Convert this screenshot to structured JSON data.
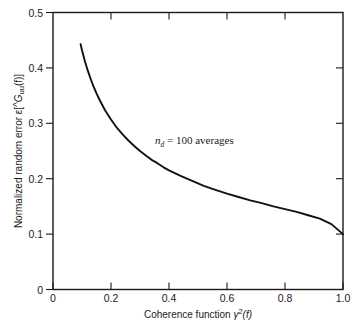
{
  "chart_data": {
    "type": "line",
    "title": "",
    "xlabel": "Coherence function γ²(f)",
    "ylabel": "Normalized random error ε[Ĝᵤᵤ(f)]",
    "xlim": [
      0,
      1.0
    ],
    "ylim": [
      0,
      0.5
    ],
    "grid": false,
    "legend": "none",
    "xticks": [
      "0",
      "0.2",
      "0.4",
      "0.6",
      "0.8",
      "1.0"
    ],
    "xtick_values": [
      0,
      0.2,
      0.4,
      0.6,
      0.8,
      1.0
    ],
    "yticks": [
      "0",
      "0.1",
      "0.2",
      "0.3",
      "0.4",
      "0.5"
    ],
    "ytick_values": [
      0,
      0.1,
      0.2,
      0.3,
      0.4,
      0.5
    ],
    "annotations": [
      {
        "text": "n_d = 100 averages",
        "x": 0.34,
        "y": 0.285
      }
    ],
    "series": [
      {
        "name": "Normalized random error",
        "n_d": 100,
        "x": [
          0.095,
          0.1,
          0.11,
          0.12,
          0.13,
          0.14,
          0.15,
          0.16,
          0.17,
          0.18,
          0.19,
          0.2,
          0.22,
          0.24,
          0.26,
          0.28,
          0.3,
          0.32,
          0.34,
          0.36,
          0.38,
          0.4,
          0.44,
          0.48,
          0.52,
          0.56,
          0.6,
          0.64,
          0.68,
          0.72,
          0.76,
          0.8,
          0.84,
          0.88,
          0.92,
          0.96,
          1.0
        ],
        "values": [
          0.443,
          0.432,
          0.412,
          0.395,
          0.38,
          0.366,
          0.354,
          0.343,
          0.333,
          0.323,
          0.315,
          0.307,
          0.292,
          0.28,
          0.269,
          0.259,
          0.25,
          0.242,
          0.234,
          0.228,
          0.221,
          0.215,
          0.205,
          0.196,
          0.187,
          0.18,
          0.173,
          0.167,
          0.161,
          0.156,
          0.15,
          0.145,
          0.14,
          0.134,
          0.128,
          0.118,
          0.1
        ]
      }
    ]
  },
  "axis": {
    "x_label_main": "Coherence function",
    "x_label_symbol": "γ",
    "x_label_sup": "2",
    "x_label_arg": "(f)",
    "y_label_main": "Normalized random error",
    "y_label_eps": "ε[",
    "y_label_G": "G",
    "y_label_sub": "uu",
    "y_label_arg": "(f)]"
  },
  "annotation": {
    "symbol": "n",
    "subscript": "d",
    "equals": "= 100 averages"
  },
  "colors": {
    "curve": "#111111",
    "axis": "#1a1a1a",
    "background": "#ffffff"
  }
}
